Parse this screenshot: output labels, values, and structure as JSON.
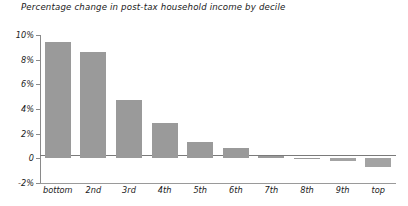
{
  "chart_data": {
    "type": "bar",
    "title": "Percentage change in post-tax household income by decile",
    "xlabel": "",
    "ylabel": "",
    "categories": [
      "bottom",
      "2nd",
      "3rd",
      "4th",
      "5th",
      "6th",
      "7th",
      "8th",
      "9th",
      "top"
    ],
    "values": [
      9.4,
      8.6,
      4.7,
      2.9,
      1.3,
      0.8,
      0.15,
      0.05,
      -0.25,
      -0.7
    ],
    "ylim": [
      -2,
      10
    ],
    "yticks": [
      10,
      8,
      6,
      4,
      2,
      0,
      -2
    ],
    "ytick_labels": [
      "10%",
      "8%",
      "6%",
      "4%",
      "2%",
      "0",
      "-2%"
    ],
    "grid": false,
    "legend": null,
    "bar_color": "#9a9a9a",
    "axis_color": "#8a8a8a",
    "text_color": "#1a1a1a"
  }
}
